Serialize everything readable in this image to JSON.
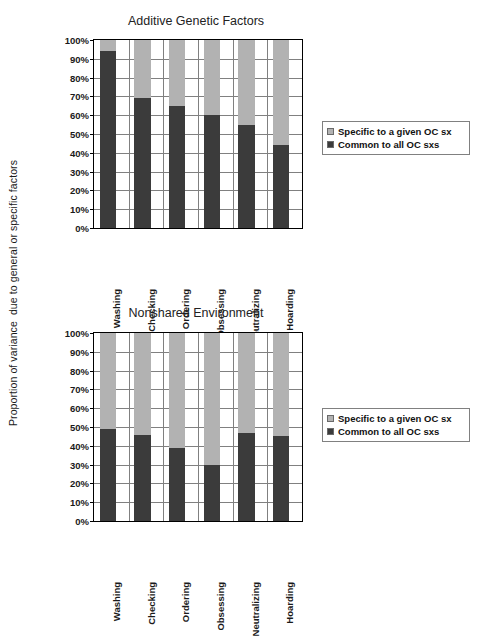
{
  "axis": {
    "title": "Proportion of variance  due to general or specific factors"
  },
  "legend": {
    "specific_label": "Specific to a given OC sx",
    "common_label": "Common to all OC sxs",
    "specific_color": "#b2b2b2",
    "common_color": "#3b3b3b"
  },
  "yticks": [
    "100%",
    "90%",
    "80%",
    "70%",
    "60%",
    "50%",
    "40%",
    "30%",
    "20%",
    "10%",
    "0%"
  ],
  "categories": [
    "Washing",
    "Checking",
    "Ordering",
    "Obsessing",
    "Neutralizing",
    "Hoarding"
  ],
  "panels": [
    {
      "title": "Additive Genetic Factors"
    },
    {
      "title": "Nonshared Environment"
    }
  ],
  "chart_data": [
    {
      "type": "bar",
      "title": "Additive Genetic Factors",
      "stacked": true,
      "xlabel": "",
      "ylabel": "Proportion of variance  due to general or specific factors",
      "ylim": [
        0,
        100
      ],
      "ytick_step": 10,
      "grid": true,
      "legend_position": "right",
      "categories": [
        "Washing",
        "Checking",
        "Ordering",
        "Obsessing",
        "Neutralizing",
        "Hoarding"
      ],
      "series": [
        {
          "name": "Common to all OC sxs",
          "color": "#3b3b3b",
          "values": [
            94,
            69,
            65,
            60,
            55,
            44
          ]
        },
        {
          "name": "Specific to a given OC sx",
          "color": "#b2b2b2",
          "values": [
            6,
            31,
            35,
            40,
            45,
            56
          ]
        }
      ]
    },
    {
      "type": "bar",
      "title": "Nonshared Environment",
      "stacked": true,
      "xlabel": "",
      "ylabel": "Proportion of variance  due to general or specific factors",
      "ylim": [
        0,
        100
      ],
      "ytick_step": 10,
      "grid": true,
      "legend_position": "right",
      "categories": [
        "Washing",
        "Checking",
        "Ordering",
        "Obsessing",
        "Neutralizing",
        "Hoarding"
      ],
      "series": [
        {
          "name": "Common to all OC sxs",
          "color": "#3b3b3b",
          "values": [
            49,
            46,
            39,
            30,
            47,
            45
          ]
        },
        {
          "name": "Specific to a given OC sx",
          "color": "#b2b2b2",
          "values": [
            51,
            54,
            61,
            70,
            53,
            55
          ]
        }
      ]
    }
  ]
}
